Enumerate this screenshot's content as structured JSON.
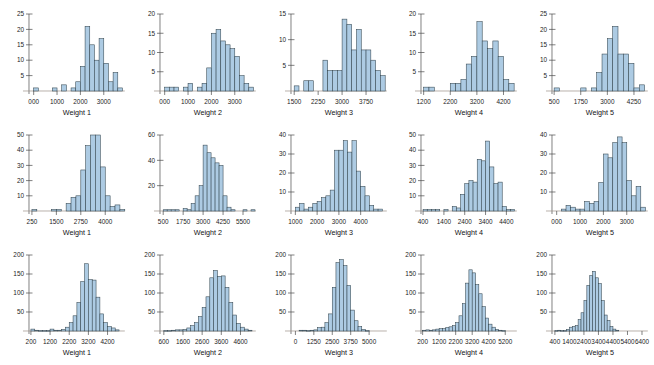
{
  "figure": {
    "panel_rows": 3,
    "panel_cols": 5,
    "bar_fill": "#adcbe3",
    "bar_stroke": "#33454f",
    "axis_color": "#4a4a4a",
    "background": "#ffffff"
  },
  "chart_data": [
    {
      "type": "bar",
      "title": "",
      "xlabel": "Weight 1",
      "ylabel": "",
      "row": 1,
      "col": 1,
      "xlim": [
        -200,
        3900
      ],
      "ylim": [
        0,
        25
      ],
      "yticks": [
        5,
        10,
        15,
        20,
        25
      ],
      "xticks": [
        0,
        1000,
        2000,
        3000
      ],
      "xtick_labels": [
        "000",
        "1000",
        "2000",
        "3000"
      ],
      "bin_width": 200,
      "bin_starts": [
        -200,
        0,
        200,
        400,
        600,
        800,
        1000,
        1200,
        1400,
        1600,
        1800,
        2000,
        2200,
        2400,
        2600,
        2800,
        3000,
        3200,
        3400,
        3600
      ],
      "values": [
        0,
        1,
        0,
        0,
        0,
        1,
        0,
        2,
        0,
        1,
        3,
        8,
        21,
        15,
        10,
        17,
        9,
        3,
        6,
        1
      ]
    },
    {
      "type": "bar",
      "title": "",
      "xlabel": "Weight 2",
      "ylabel": "",
      "row": 1,
      "col": 2,
      "xlim": [
        -200,
        3900
      ],
      "ylim": [
        0,
        20
      ],
      "yticks": [
        5,
        10,
        15,
        20
      ],
      "xticks": [
        0,
        1000,
        2000,
        3000
      ],
      "xtick_labels": [
        "000",
        "1000",
        "2000",
        "3000"
      ],
      "bin_width": 200,
      "bin_starts": [
        -200,
        0,
        200,
        400,
        600,
        800,
        1000,
        1200,
        1400,
        1600,
        1800,
        2000,
        2200,
        2400,
        2600,
        2800,
        3000,
        3200,
        3400,
        3600
      ],
      "values": [
        0,
        1,
        1,
        1,
        0,
        1,
        2,
        0,
        1,
        2,
        6,
        15,
        16,
        13,
        12,
        11,
        9,
        4,
        2,
        1
      ]
    },
    {
      "type": "bar",
      "title": "",
      "xlabel": "Weight 3",
      "ylabel": "",
      "row": 1,
      "col": 3,
      "xlim": [
        1400,
        4400
      ],
      "ylim": [
        0,
        15
      ],
      "yticks": [
        5,
        10,
        15
      ],
      "xticks": [
        1500,
        2250,
        3000,
        3750
      ],
      "xtick_labels": [
        "1500",
        "2250",
        "3000",
        "3750"
      ],
      "bin_width": 150,
      "bin_starts": [
        1500,
        1650,
        1800,
        1950,
        2100,
        2250,
        2400,
        2550,
        2700,
        2850,
        3000,
        3150,
        3300,
        3450,
        3600,
        3750,
        3900,
        4050,
        4200
      ],
      "values": [
        1,
        0,
        2,
        2,
        0,
        0,
        6,
        4,
        4,
        4,
        14,
        13,
        8,
        12,
        8,
        8,
        6,
        4,
        3
      ]
    },
    {
      "type": "bar",
      "title": "",
      "xlabel": "Weight 4",
      "ylabel": "",
      "row": 1,
      "col": 4,
      "xlim": [
        1100,
        4700
      ],
      "ylim": [
        0,
        20
      ],
      "yticks": [
        5,
        10,
        15,
        20
      ],
      "xticks": [
        1200,
        2200,
        3200,
        4200
      ],
      "xtick_labels": [
        "1200",
        "2200",
        "3200",
        "4200"
      ],
      "bin_width": 200,
      "bin_starts": [
        1200,
        1400,
        1600,
        1800,
        2000,
        2200,
        2400,
        2600,
        2800,
        3000,
        3200,
        3400,
        3600,
        3800,
        4000,
        4200,
        4400
      ],
      "values": [
        1,
        1,
        0,
        0,
        0,
        2,
        2,
        3,
        7,
        9,
        18,
        13,
        11,
        13,
        9,
        3,
        2
      ]
    },
    {
      "type": "bar",
      "title": "",
      "xlabel": "Weight 5",
      "ylabel": "",
      "row": 1,
      "col": 5,
      "xlim": [
        400,
        4900
      ],
      "ylim": [
        0,
        25
      ],
      "yticks": [
        5,
        10,
        15,
        20,
        25
      ],
      "xticks": [
        500,
        1750,
        3000,
        4250
      ],
      "xtick_labels": [
        "500",
        "1750",
        "3000",
        "4250"
      ],
      "bin_width": 250,
      "bin_starts": [
        500,
        750,
        1000,
        1250,
        1500,
        1750,
        2000,
        2250,
        2500,
        2750,
        3000,
        3250,
        3500,
        3750,
        4000,
        4250,
        4500
      ],
      "values": [
        1,
        0,
        0,
        0,
        0,
        1,
        0,
        1,
        6,
        12,
        17,
        21,
        12,
        12,
        9,
        1,
        2
      ]
    },
    {
      "type": "bar",
      "title": "",
      "xlabel": "Weight 1",
      "ylabel": "",
      "row": 2,
      "col": 1,
      "xlim": [
        100,
        5000
      ],
      "ylim": [
        0,
        50
      ],
      "yticks": [
        10,
        20,
        30,
        40,
        50
      ],
      "xticks": [
        250,
        1500,
        2750,
        4000
      ],
      "xtick_labels": [
        "250",
        "1500",
        "2750",
        "4000"
      ],
      "bin_width": 250,
      "bin_starts": [
        250,
        500,
        750,
        1000,
        1250,
        1500,
        1750,
        2000,
        2250,
        2500,
        2750,
        3000,
        3250,
        3500,
        3750,
        4000,
        4250,
        4500,
        4750
      ],
      "values": [
        1,
        0,
        0,
        0,
        1,
        1,
        0,
        5,
        9,
        10,
        27,
        43,
        50,
        50,
        29,
        10,
        3,
        4,
        1
      ]
    },
    {
      "type": "bar",
      "title": "",
      "xlabel": "Weight 2",
      "ylabel": "",
      "row": 2,
      "col": 2,
      "xlim": [
        300,
        6300
      ],
      "ylim": [
        0,
        60
      ],
      "yticks": [
        20,
        40,
        60
      ],
      "xticks": [
        500,
        1750,
        3000,
        4250,
        5500
      ],
      "xtick_labels": [
        "500",
        "1750",
        "3000",
        "4250",
        "5500"
      ],
      "bin_width": 250,
      "bin_starts": [
        500,
        750,
        1000,
        1250,
        1500,
        1750,
        2000,
        2250,
        2500,
        2750,
        3000,
        3250,
        3500,
        3750,
        4000,
        4250,
        4500,
        4750,
        5000,
        5250,
        5500,
        5750,
        6000
      ],
      "values": [
        1,
        1,
        1,
        1,
        0,
        2,
        1,
        6,
        12,
        20,
        52,
        46,
        42,
        38,
        36,
        12,
        3,
        1,
        0,
        0,
        1,
        0,
        1
      ]
    },
    {
      "type": "bar",
      "title": "",
      "xlabel": "Weight 3",
      "ylabel": "",
      "row": 2,
      "col": 3,
      "xlim": [
        800,
        5200
      ],
      "ylim": [
        0,
        40
      ],
      "yticks": [
        10,
        20,
        30,
        40
      ],
      "xticks": [
        1000,
        2000,
        3000,
        4000
      ],
      "xtick_labels": [
        "1000",
        "2000",
        "3000",
        "4000"
      ],
      "bin_width": 200,
      "bin_starts": [
        1000,
        1200,
        1400,
        1600,
        1800,
        2000,
        2200,
        2400,
        2600,
        2800,
        3000,
        3200,
        3400,
        3600,
        3800,
        4000,
        4200,
        4400,
        4600,
        4800
      ],
      "values": [
        2,
        4,
        1,
        2,
        4,
        5,
        7,
        8,
        11,
        32,
        32,
        37,
        31,
        37,
        21,
        13,
        8,
        3,
        1,
        1
      ]
    },
    {
      "type": "bar",
      "title": "",
      "xlabel": "Weight 4",
      "ylabel": "",
      "row": 2,
      "col": 4,
      "xlim": [
        300,
        4900
      ],
      "ylim": [
        0,
        50
      ],
      "yticks": [
        10,
        20,
        30,
        40,
        50
      ],
      "xticks": [
        400,
        1400,
        2400,
        3400,
        4400
      ],
      "xtick_labels": [
        "400",
        "1400",
        "2400",
        "3400",
        "4400"
      ],
      "bin_width": 200,
      "bin_starts": [
        400,
        600,
        800,
        1000,
        1200,
        1400,
        1600,
        1800,
        2000,
        2200,
        2400,
        2600,
        2800,
        3000,
        3200,
        3400,
        3600,
        3800,
        4000,
        4200,
        4400,
        4600
      ],
      "values": [
        1,
        1,
        1,
        1,
        0,
        1,
        0,
        3,
        2,
        11,
        18,
        20,
        19,
        34,
        33,
        46,
        29,
        18,
        19,
        3,
        1,
        1
      ]
    },
    {
      "type": "bar",
      "title": "",
      "xlabel": "Weight 5",
      "ylabel": "",
      "row": 2,
      "col": 5,
      "xlim": [
        -200,
        3900
      ],
      "ylim": [
        0,
        40
      ],
      "yticks": [
        10,
        20,
        30,
        40
      ],
      "xticks": [
        0,
        1000,
        2000,
        3000
      ],
      "xtick_labels": [
        "000",
        "1000",
        "2000",
        "3000"
      ],
      "bin_width": 200,
      "bin_starts": [
        200,
        400,
        600,
        800,
        1000,
        1200,
        1400,
        1600,
        1800,
        2000,
        2200,
        2400,
        2600,
        2800,
        3000,
        3200,
        3400,
        3600
      ],
      "values": [
        1,
        3,
        2,
        1,
        1,
        5,
        4,
        5,
        15,
        30,
        28,
        36,
        39,
        36,
        16,
        8,
        13,
        2
      ]
    },
    {
      "type": "bar",
      "title": "",
      "xlabel": "Weight 1",
      "ylabel": "",
      "row": 3,
      "col": 1,
      "xlim": [
        100,
        5100
      ],
      "ylim": [
        0,
        200
      ],
      "yticks": [
        50,
        100,
        150,
        200
      ],
      "xticks": [
        200,
        1200,
        2200,
        3200,
        4200
      ],
      "xtick_labels": [
        "200",
        "1200",
        "2200",
        "3200",
        "4200"
      ],
      "bin_width": 200,
      "bin_starts": [
        200,
        400,
        600,
        800,
        1000,
        1200,
        1400,
        1600,
        1800,
        2000,
        2200,
        2400,
        2600,
        2800,
        3000,
        3200,
        3400,
        3600,
        3800,
        4000,
        4200,
        4400,
        4600
      ],
      "values": [
        5,
        2,
        1,
        1,
        1,
        5,
        2,
        2,
        4,
        10,
        22,
        40,
        75,
        130,
        177,
        135,
        134,
        89,
        45,
        22,
        12,
        8,
        3
      ]
    },
    {
      "type": "bar",
      "title": "",
      "xlabel": "Weight 2",
      "ylabel": "",
      "row": 3,
      "col": 2,
      "xlim": [
        400,
        5400
      ],
      "ylim": [
        0,
        200
      ],
      "yticks": [
        50,
        100,
        150,
        200
      ],
      "xticks": [
        600,
        1600,
        2600,
        3600,
        4600
      ],
      "xtick_labels": [
        "600",
        "1600",
        "2600",
        "3600",
        "4600"
      ],
      "bin_width": 200,
      "bin_starts": [
        600,
        800,
        1000,
        1200,
        1400,
        1600,
        1800,
        2000,
        2200,
        2400,
        2600,
        2800,
        3000,
        3200,
        3400,
        3600,
        3800,
        4000,
        4200,
        4400,
        4600,
        4800,
        5000
      ],
      "values": [
        1,
        1,
        2,
        3,
        3,
        4,
        8,
        14,
        22,
        38,
        62,
        90,
        140,
        159,
        144,
        145,
        115,
        75,
        42,
        20,
        10,
        5,
        2
      ]
    },
    {
      "type": "bar",
      "title": "",
      "xlabel": "Weight 3",
      "ylabel": "",
      "row": 3,
      "col": 3,
      "xlim": [
        -300,
        6200
      ],
      "ylim": [
        0,
        200
      ],
      "yticks": [
        50,
        100,
        150,
        200
      ],
      "xticks": [
        0,
        1250,
        2500,
        3750,
        5000
      ],
      "xtick_labels": [
        "0",
        "1250",
        "2500",
        "3750",
        "5000"
      ],
      "bin_width": 250,
      "bin_starts": [
        250,
        500,
        750,
        1000,
        1250,
        1500,
        1750,
        2000,
        2250,
        2500,
        2750,
        3000,
        3250,
        3500,
        3750,
        4000,
        4250,
        4500,
        4750
      ],
      "values": [
        2,
        2,
        1,
        2,
        3,
        9,
        10,
        22,
        45,
        115,
        180,
        188,
        172,
        120,
        55,
        27,
        12,
        4,
        1
      ]
    },
    {
      "type": "bar",
      "title": "",
      "xlabel": "Weight 4",
      "ylabel": "",
      "row": 3,
      "col": 4,
      "xlim": [
        100,
        5900
      ],
      "ylim": [
        0,
        200
      ],
      "yticks": [
        50,
        100,
        150,
        200
      ],
      "xticks": [
        200,
        1200,
        2200,
        3200,
        4200,
        5200
      ],
      "xtick_labels": [
        "200",
        "1200",
        "2200",
        "3200",
        "4200",
        "5200"
      ],
      "bin_width": 200,
      "bin_starts": [
        200,
        400,
        600,
        800,
        1000,
        1200,
        1400,
        1600,
        1800,
        2000,
        2200,
        2400,
        2600,
        2800,
        3000,
        3200,
        3400,
        3600,
        3800,
        4000,
        4200,
        4400,
        4600,
        4800,
        5000
      ],
      "values": [
        2,
        3,
        2,
        3,
        5,
        6,
        6,
        9,
        11,
        14,
        22,
        40,
        72,
        126,
        161,
        153,
        122,
        98,
        64,
        34,
        18,
        10,
        4,
        2,
        1
      ]
    },
    {
      "type": "bar",
      "title": "",
      "xlabel": "Weight 5",
      "ylabel": "",
      "row": 3,
      "col": 5,
      "xlim": [
        200,
        6800
      ],
      "ylim": [
        0,
        200
      ],
      "yticks": [
        50,
        100,
        150,
        200
      ],
      "xticks": [
        400,
        1400,
        2400,
        3400,
        4400,
        5400,
        6400
      ],
      "xtick_labels": [
        "400",
        "1400",
        "2400",
        "3400",
        "4400",
        "5400",
        "6400"
      ],
      "bin_width": 200,
      "bin_starts": [
        400,
        600,
        800,
        1000,
        1200,
        1400,
        1600,
        1800,
        2000,
        2200,
        2400,
        2600,
        2800,
        3000,
        3200,
        3400,
        3600,
        3800,
        4000,
        4200,
        4400,
        4600
      ],
      "values": [
        1,
        2,
        1,
        1,
        4,
        10,
        12,
        14,
        30,
        48,
        80,
        120,
        146,
        157,
        140,
        125,
        80,
        42,
        28,
        12,
        5,
        2
      ]
    }
  ]
}
